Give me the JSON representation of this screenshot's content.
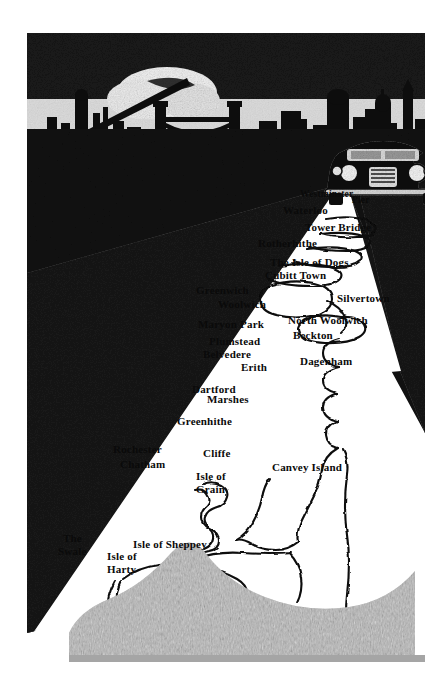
{
  "illustration": {
    "title": "Thames Estuary map illuminated by car headlights",
    "style": "black-and-white woodcut / scraperboard engraving",
    "background_color": "#ffffff",
    "ink_color": "#0a0a0a",
    "beam_color": "#ffffff",
    "ground_color": "#b9b9b9"
  },
  "scene": {
    "skyline_name": "london-skyline-silhouette",
    "searchlight_name": "searchlight-beam",
    "cloud_name": "glowing-cloud",
    "bridge_name": "tower-bridge-silhouette",
    "car_name": "car-with-headlights",
    "headlight_beam_name": "headlight-light-beam",
    "river_name": "river-thames-outline",
    "ground_name": "foreground-ground-texture"
  },
  "map_labels": [
    {
      "text": "Westminster",
      "x": 300,
      "y": 190,
      "size": "sm"
    },
    {
      "text": "Pier",
      "x": 352,
      "y": 196,
      "size": "sm"
    },
    {
      "text": "Waterloo",
      "x": 283,
      "y": 205,
      "size": "md"
    },
    {
      "text": "Tower Bridge",
      "x": 305,
      "y": 222,
      "size": "md"
    },
    {
      "text": "Rotherhithe",
      "x": 258,
      "y": 238,
      "size": "md"
    },
    {
      "text": "The Isle of Dogs",
      "x": 270,
      "y": 257,
      "size": "md"
    },
    {
      "text": "Cubitt Town",
      "x": 265,
      "y": 270,
      "size": "md"
    },
    {
      "text": "Greenwich",
      "x": 196,
      "y": 285,
      "size": "md"
    },
    {
      "text": "Woolwich",
      "x": 218,
      "y": 299,
      "size": "md"
    },
    {
      "text": "Silvertown",
      "x": 337,
      "y": 293,
      "size": "md"
    },
    {
      "text": "Maryon Park",
      "x": 198,
      "y": 319,
      "size": "md"
    },
    {
      "text": "North Woolwich",
      "x": 288,
      "y": 315,
      "size": "md"
    },
    {
      "text": "Plumstead",
      "x": 209,
      "y": 336,
      "size": "md"
    },
    {
      "text": "Beckton",
      "x": 293,
      "y": 330,
      "size": "md"
    },
    {
      "text": "Belvedere",
      "x": 203,
      "y": 349,
      "size": "md"
    },
    {
      "text": "Erith",
      "x": 241,
      "y": 362,
      "size": "md"
    },
    {
      "text": "Dagenham",
      "x": 300,
      "y": 356,
      "size": "md"
    },
    {
      "text": "Dartford",
      "x": 192,
      "y": 384,
      "size": "md"
    },
    {
      "text": "Marshes",
      "x": 207,
      "y": 394,
      "size": "md"
    },
    {
      "text": "Greenhithe",
      "x": 177,
      "y": 416,
      "size": "md"
    },
    {
      "text": "Rochester",
      "x": 113,
      "y": 444,
      "size": "md"
    },
    {
      "text": "Cliffe",
      "x": 203,
      "y": 448,
      "size": "md"
    },
    {
      "text": "Chatham",
      "x": 120,
      "y": 459,
      "size": "md"
    },
    {
      "text": "Canvey Island",
      "x": 272,
      "y": 462,
      "size": "md"
    },
    {
      "text": "Isle of",
      "x": 196,
      "y": 471,
      "size": "md"
    },
    {
      "text": "Grain",
      "x": 196,
      "y": 484,
      "size": "md"
    },
    {
      "text": "The",
      "x": 63,
      "y": 533,
      "size": "md"
    },
    {
      "text": "Isle of Sheppey",
      "x": 133,
      "y": 539,
      "size": "md"
    },
    {
      "text": "Swale",
      "x": 58,
      "y": 546,
      "size": "md"
    },
    {
      "text": "Isle of",
      "x": 107,
      "y": 551,
      "size": "md"
    },
    {
      "text": "Harty",
      "x": 107,
      "y": 564,
      "size": "md"
    }
  ]
}
